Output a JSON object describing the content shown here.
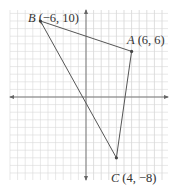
{
  "diagram": {
    "type": "coordinate-plane-triangle",
    "grid": {
      "x_min": -10,
      "x_max": 10,
      "y_min": -10,
      "y_max": 11,
      "unit_px": 7.6
    },
    "origin_px": [
      86,
      97
    ],
    "colors": {
      "grid": "#d8d8d8",
      "axis": "#777777",
      "line": "#555555",
      "text": "#333333"
    },
    "points": [
      {
        "name": "B",
        "coords": "(−6, 10)",
        "x": -6,
        "y": 10
      },
      {
        "name": "A",
        "coords": "(6, 6)",
        "x": 6,
        "y": 6
      },
      {
        "name": "C",
        "coords": "(4, −8)",
        "x": 4,
        "y": -8
      }
    ]
  }
}
